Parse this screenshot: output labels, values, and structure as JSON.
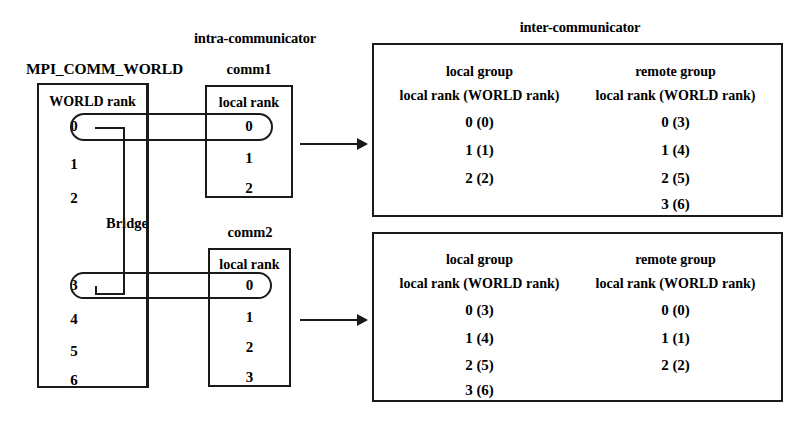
{
  "figure": {
    "headings": {
      "intra": "intra-communicator",
      "inter": "inter-communicator",
      "bridge": "Bridge"
    }
  },
  "world": {
    "title": "MPI_COMM_WORLD",
    "column_header": "WORLD rank",
    "ranks": [
      "0",
      "1",
      "2",
      "3",
      "4",
      "5",
      "6"
    ]
  },
  "comm1": {
    "title": "comm1",
    "column_header": "local rank",
    "ranks": [
      "0",
      "1",
      "2"
    ]
  },
  "comm2": {
    "title": "comm2",
    "column_header": "local rank",
    "ranks": [
      "0",
      "1",
      "2",
      "3"
    ]
  },
  "inter1": {
    "local_group": {
      "title": "local group",
      "column_header": "local rank (WORLD rank)",
      "entries": [
        "0 (0)",
        "1 (1)",
        "2 (2)"
      ]
    },
    "remote_group": {
      "title": "remote group",
      "column_header": "local rank (WORLD rank)",
      "entries": [
        "0 (3)",
        "1 (4)",
        "2 (5)",
        "3 (6)"
      ]
    }
  },
  "inter2": {
    "local_group": {
      "title": "local group",
      "column_header": "local rank (WORLD rank)",
      "entries": [
        "0 (3)",
        "1 (4)",
        "2 (5)",
        "3 (6)"
      ]
    },
    "remote_group": {
      "title": "remote group",
      "column_header": "local rank (WORLD rank)",
      "entries": [
        "0 (0)",
        "1 (1)",
        "2 (2)"
      ]
    }
  },
  "colors": {
    "ink": "#1a1a1a",
    "background": "#ffffff"
  }
}
